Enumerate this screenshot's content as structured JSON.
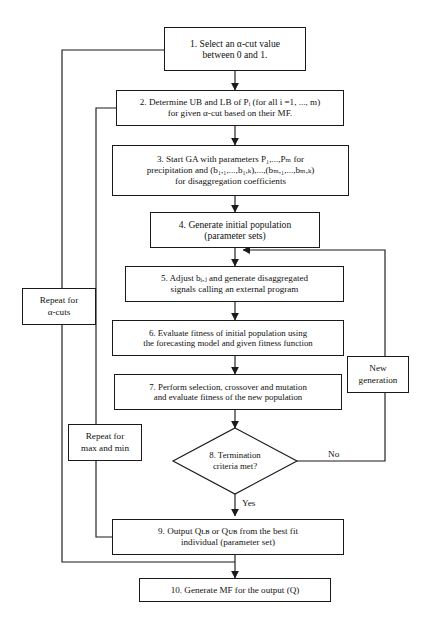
{
  "diagram": {
    "type": "flowchart",
    "orientation": "top-to-bottom",
    "line_color": "#1a1a1a",
    "background_color": "#ffffff"
  },
  "nodes": {
    "step1": {
      "id": "1",
      "shape": "rectangle",
      "line1": "1. Select an α-cut value",
      "line2": "between 0 and 1."
    },
    "step2": {
      "id": "2",
      "shape": "rectangle",
      "line1": "2. Determine UB and LB of Pᵢ (for all i =1, ..., m)",
      "line2": "for given α-cut based on their MF."
    },
    "step3": {
      "id": "3",
      "shape": "rectangle",
      "line1": "3. Start GA with parameters P₁,...,Pₘ for",
      "line2": "precipitation and (b₁,₁,...,b₁,ₖ),...,(bₘ,₁,...,bₘ,ₖ)",
      "line3": "for disaggregation coefficients"
    },
    "step4": {
      "id": "4",
      "shape": "rectangle",
      "line1": "4. Generate initial population",
      "line2": "(parameter sets)"
    },
    "step5": {
      "id": "5",
      "shape": "rectangle",
      "line1": "5. Adjust bᵢ,ⱼ and generate disaggregated",
      "line2": "signals calling an external program"
    },
    "step6": {
      "id": "6",
      "shape": "rectangle",
      "line1": "6. Evaluate fitness of initial population using",
      "line2": "the forecasting model and given fitness function"
    },
    "step7": {
      "id": "7",
      "shape": "rectangle",
      "line1": "7. Perform selection, crossover and mutation",
      "line2": "and evaluate fitness of the new population"
    },
    "step8": {
      "id": "8",
      "shape": "diamond",
      "line1": "8. Termination",
      "line2": "criteria met?"
    },
    "step9": {
      "id": "9",
      "shape": "rectangle",
      "line1": "9. Output Qʟʙ or Qᴜʙ from the best fit",
      "line2": "individual (parameter set)"
    },
    "step10": {
      "id": "10",
      "shape": "rectangle",
      "line1": "10. Generate MF for the output (Q)"
    }
  },
  "side_labels": {
    "repeat_alpha": {
      "line1": "Repeat for",
      "line2": "α-cuts"
    },
    "repeat_maxmin": {
      "line1": "Repeat for",
      "line2": "max and min"
    },
    "new_generation": {
      "line1": "New",
      "line2": "generation"
    }
  },
  "edge_labels": {
    "no": "No",
    "yes": "Yes"
  }
}
